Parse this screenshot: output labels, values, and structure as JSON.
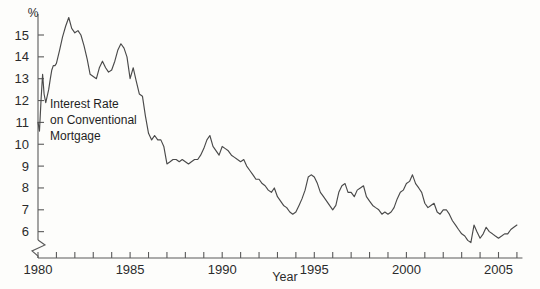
{
  "chart_data": {
    "type": "line",
    "title": "",
    "xlabel": "Year",
    "ylabel": "%",
    "unit_label": "%",
    "annotation": [
      "Interest Rate",
      "on Conventional",
      "Mortgage"
    ],
    "annotation_text": "Interest Rate on Conventional Mortgage",
    "xlim": [
      1980,
      2006.3
    ],
    "ylim": [
      5.5,
      15.9
    ],
    "y_axis_break": true,
    "grid": false,
    "legend": "none",
    "line_color": "#4a4a4a",
    "background_color": "#fdfdfb",
    "axis_color": "#5a5a5a",
    "ytick_labels": [
      "15",
      "14",
      "13",
      "12",
      "11",
      "10",
      "9",
      "8",
      "7",
      "6"
    ],
    "ytick_values": [
      15,
      14,
      13,
      12,
      11,
      10,
      9,
      8,
      7,
      6
    ],
    "xtick_labels": [
      "1980",
      "1985",
      "1990",
      "1995",
      "2000",
      "2005"
    ],
    "xtick_values": [
      1980,
      1985,
      1990,
      1995,
      2000,
      2005
    ],
    "xtick_minor_values": [
      1981,
      1982,
      1983,
      1984,
      1986,
      1987,
      1988,
      1989,
      1991,
      1992,
      1993,
      1994,
      1996,
      1997,
      1998,
      1999,
      2001,
      2002,
      2003,
      2004,
      2006
    ],
    "series": [
      {
        "name": "Interest Rate on Conventional Mortgage",
        "x": [
          1980.0,
          1980.08,
          1980.17,
          1980.25,
          1980.33,
          1980.42,
          1980.5,
          1980.58,
          1980.67,
          1980.75,
          1980.83,
          1980.92,
          1981.0,
          1981.17,
          1981.33,
          1981.5,
          1981.67,
          1981.83,
          1982.0,
          1982.17,
          1982.33,
          1982.5,
          1982.67,
          1982.83,
          1983.0,
          1983.17,
          1983.33,
          1983.5,
          1983.67,
          1983.83,
          1984.0,
          1984.17,
          1984.33,
          1984.5,
          1984.67,
          1984.83,
          1985.0,
          1985.17,
          1985.33,
          1985.5,
          1985.67,
          1985.83,
          1986.0,
          1986.17,
          1986.33,
          1986.5,
          1986.67,
          1986.83,
          1987.0,
          1987.17,
          1987.33,
          1987.5,
          1987.67,
          1987.83,
          1988.0,
          1988.17,
          1988.33,
          1988.5,
          1988.67,
          1988.83,
          1989.0,
          1989.17,
          1989.33,
          1989.5,
          1989.67,
          1989.83,
          1990.0,
          1990.17,
          1990.33,
          1990.5,
          1990.67,
          1990.83,
          1991.0,
          1991.17,
          1991.33,
          1991.5,
          1991.67,
          1991.83,
          1992.0,
          1992.17,
          1992.33,
          1992.5,
          1992.67,
          1992.83,
          1993.0,
          1993.17,
          1993.33,
          1993.5,
          1993.67,
          1993.83,
          1994.0,
          1994.17,
          1994.33,
          1994.5,
          1994.67,
          1994.83,
          1995.0,
          1995.17,
          1995.33,
          1995.5,
          1995.67,
          1995.83,
          1996.0,
          1996.17,
          1996.33,
          1996.5,
          1996.67,
          1996.83,
          1997.0,
          1997.17,
          1997.33,
          1997.5,
          1997.67,
          1997.83,
          1998.0,
          1998.17,
          1998.33,
          1998.5,
          1998.67,
          1998.83,
          1999.0,
          1999.17,
          1999.33,
          1999.5,
          1999.67,
          1999.83,
          2000.0,
          2000.17,
          2000.33,
          2000.5,
          2000.67,
          2000.83,
          2001.0,
          2001.17,
          2001.33,
          2001.5,
          2001.67,
          2001.83,
          2002.0,
          2002.17,
          2002.33,
          2002.5,
          2002.67,
          2002.83,
          2003.0,
          2003.17,
          2003.33,
          2003.5,
          2003.67,
          2003.83,
          2004.0,
          2004.17,
          2004.33,
          2004.5,
          2004.67,
          2004.83,
          2005.0,
          2005.17,
          2005.33,
          2005.5,
          2005.67,
          2005.83,
          2006.0
        ],
        "y": [
          11.0,
          10.6,
          12.1,
          13.2,
          12.3,
          11.9,
          12.2,
          12.5,
          13.0,
          13.4,
          13.6,
          13.6,
          13.7,
          14.3,
          14.9,
          15.4,
          15.8,
          15.3,
          15.1,
          15.2,
          15.0,
          14.5,
          13.9,
          13.2,
          13.1,
          13.0,
          13.5,
          13.8,
          13.5,
          13.3,
          13.4,
          13.8,
          14.3,
          14.6,
          14.4,
          14.0,
          13.0,
          13.5,
          12.9,
          12.3,
          12.2,
          11.3,
          10.5,
          10.2,
          10.4,
          10.2,
          10.2,
          9.9,
          9.1,
          9.2,
          9.3,
          9.3,
          9.2,
          9.3,
          9.2,
          9.1,
          9.2,
          9.3,
          9.3,
          9.5,
          9.8,
          10.2,
          10.4,
          9.9,
          9.7,
          9.5,
          9.9,
          9.8,
          9.7,
          9.5,
          9.4,
          9.3,
          9.2,
          9.3,
          9.0,
          8.8,
          8.6,
          8.4,
          8.4,
          8.2,
          8.1,
          7.9,
          7.8,
          8.0,
          7.6,
          7.4,
          7.2,
          7.1,
          6.9,
          6.8,
          6.9,
          7.2,
          7.5,
          7.9,
          8.5,
          8.6,
          8.5,
          8.2,
          7.8,
          7.6,
          7.4,
          7.2,
          7.0,
          7.2,
          7.8,
          8.1,
          8.2,
          7.8,
          7.8,
          7.6,
          7.9,
          8.0,
          8.1,
          7.6,
          7.4,
          7.2,
          7.1,
          7.0,
          6.8,
          6.9,
          6.8,
          6.9,
          7.1,
          7.5,
          7.8,
          7.9,
          8.2,
          8.3,
          8.6,
          8.2,
          8.0,
          7.8,
          7.3,
          7.1,
          7.2,
          7.3,
          6.9,
          6.8,
          7.0,
          7.0,
          6.8,
          6.5,
          6.3,
          6.1,
          5.9,
          5.8,
          5.6,
          5.5,
          6.3,
          6.0,
          5.7,
          5.9,
          6.2,
          6.0,
          5.9,
          5.8,
          5.7,
          5.8,
          5.9,
          5.9,
          6.1,
          6.2,
          6.3
        ]
      }
    ]
  }
}
